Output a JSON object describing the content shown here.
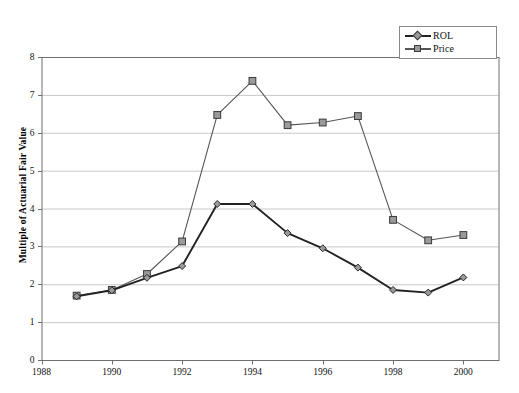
{
  "chart_data": {
    "type": "line",
    "title": "",
    "xlabel": "",
    "ylabel": "Multiple of Actuarial Fair Value",
    "x": [
      1989,
      1990,
      1991,
      1992,
      1993,
      1994,
      1995,
      1996,
      1997,
      1998,
      1999,
      2000
    ],
    "xlim": [
      1988,
      2001
    ],
    "ylim": [
      0,
      8
    ],
    "xticks": [
      1988,
      1990,
      1992,
      1994,
      1996,
      1998,
      2000
    ],
    "xtick_labels": [
      "1988",
      "1990",
      "1992",
      "1994",
      "1996",
      "1998",
      "2000"
    ],
    "yticks": [
      0,
      1,
      2,
      3,
      4,
      5,
      6,
      7,
      8
    ],
    "ytick_labels": [
      "0",
      "1",
      "2",
      "3",
      "4",
      "5",
      "6",
      "7",
      "8"
    ],
    "grid": "horizontal",
    "legend_position": "top-right",
    "series": [
      {
        "name": "ROL",
        "marker": "diamond",
        "color": "#222222",
        "marker_fill": "#9a9a9a",
        "values": [
          1.68,
          1.84,
          2.17,
          2.48,
          4.12,
          4.12,
          3.35,
          2.95,
          2.44,
          1.85,
          1.78,
          2.18
        ]
      },
      {
        "name": "Price",
        "marker": "square",
        "color": "#555555",
        "marker_fill": "#9a9a9a",
        "values": [
          1.7,
          1.85,
          2.27,
          3.13,
          6.47,
          7.37,
          6.2,
          6.27,
          6.44,
          3.7,
          3.16,
          3.3
        ]
      }
    ]
  },
  "legend": {
    "entries": [
      {
        "label": "ROL",
        "icon": "diamond-marker-icon"
      },
      {
        "label": "Price",
        "icon": "square-marker-icon"
      }
    ]
  },
  "axes": {
    "y_title": "Multiple of Actuarial Fair Value"
  },
  "colors": {
    "plot_border": "#6f6f6f",
    "gridline": "#c8c8c8",
    "rol_line": "#222222",
    "price_line": "#555555",
    "marker_fill": "#9a9a9a",
    "background": "#ffffff"
  }
}
